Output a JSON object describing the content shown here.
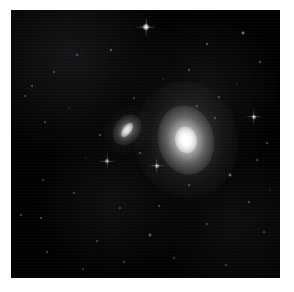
{
  "image": {
    "kind": "astronomical-photograph",
    "subject": "pair of galaxies in a sparse star field",
    "background_color": "#000000",
    "page_color": "#ffffff",
    "plate": {
      "left": 11,
      "top": 10,
      "width": 269,
      "height": 268
    },
    "caption": "",
    "title": ""
  },
  "galaxies": [
    {
      "name": "bright-elliptical-galaxy",
      "cx": 175,
      "cy": 130,
      "halo_w": 104,
      "halo_h": 118,
      "body_w": 56,
      "body_h": 70,
      "core_w": 22,
      "core_h": 27,
      "rotation": -12,
      "brightness": "bright"
    },
    {
      "name": "small-spiral-galaxy",
      "cx": 116,
      "cy": 120,
      "halo_w": 46,
      "halo_h": 52,
      "body_w": 26,
      "body_h": 34,
      "core_w": 9,
      "core_h": 17,
      "rotation": 38,
      "brightness": "faint"
    }
  ],
  "stars": [
    {
      "x": 135,
      "y": 17,
      "size": 7,
      "op": 0.95,
      "spike": 9
    },
    {
      "x": 232,
      "y": 23,
      "size": 4,
      "op": 0.55,
      "spike": 0
    },
    {
      "x": 196,
      "y": 34,
      "size": 3,
      "op": 0.4,
      "spike": 0
    },
    {
      "x": 100,
      "y": 40,
      "size": 3,
      "op": 0.38,
      "spike": 0
    },
    {
      "x": 66,
      "y": 45,
      "size": 3,
      "op": 0.34,
      "spike": 0
    },
    {
      "x": 249,
      "y": 52,
      "size": 3,
      "op": 0.38,
      "spike": 0
    },
    {
      "x": 43,
      "y": 62,
      "size": 3,
      "op": 0.3,
      "spike": 0
    },
    {
      "x": 178,
      "y": 60,
      "size": 3,
      "op": 0.32,
      "spike": 0
    },
    {
      "x": 21,
      "y": 76,
      "size": 3,
      "op": 0.34,
      "spike": 0
    },
    {
      "x": 14,
      "y": 86,
      "size": 3,
      "op": 0.3,
      "spike": 0
    },
    {
      "x": 208,
      "y": 87,
      "size": 3,
      "op": 0.32,
      "spike": 0
    },
    {
      "x": 123,
      "y": 88,
      "size": 3,
      "op": 0.3,
      "spike": 0
    },
    {
      "x": 243,
      "y": 107,
      "size": 5,
      "op": 0.72,
      "spike": 7
    },
    {
      "x": 204,
      "y": 108,
      "size": 3,
      "op": 0.3,
      "spike": 0
    },
    {
      "x": 34,
      "y": 112,
      "size": 3,
      "op": 0.3,
      "spike": 0
    },
    {
      "x": 89,
      "y": 125,
      "size": 3,
      "op": 0.32,
      "spike": 0
    },
    {
      "x": 96,
      "y": 151,
      "size": 5,
      "op": 0.62,
      "spike": 8
    },
    {
      "x": 146,
      "y": 156,
      "size": 5,
      "op": 0.7,
      "spike": 7
    },
    {
      "x": 129,
      "y": 143,
      "size": 3,
      "op": 0.34,
      "spike": 0
    },
    {
      "x": 256,
      "y": 133,
      "size": 3,
      "op": 0.36,
      "spike": 0
    },
    {
      "x": 246,
      "y": 150,
      "size": 3,
      "op": 0.32,
      "spike": 0
    },
    {
      "x": 219,
      "y": 165,
      "size": 4,
      "op": 0.48,
      "spike": 0
    },
    {
      "x": 178,
      "y": 175,
      "size": 3,
      "op": 0.3,
      "spike": 0
    },
    {
      "x": 32,
      "y": 170,
      "size": 3,
      "op": 0.28,
      "spike": 0
    },
    {
      "x": 63,
      "y": 183,
      "size": 3,
      "op": 0.3,
      "spike": 0
    },
    {
      "x": 148,
      "y": 196,
      "size": 3,
      "op": 0.3,
      "spike": 0
    },
    {
      "x": 109,
      "y": 198,
      "size": 3,
      "op": 0.28,
      "spike": 0
    },
    {
      "x": 238,
      "y": 192,
      "size": 3,
      "op": 0.3,
      "spike": 0
    },
    {
      "x": 10,
      "y": 205,
      "size": 3,
      "op": 0.34,
      "spike": 0
    },
    {
      "x": 30,
      "y": 208,
      "size": 3,
      "op": 0.34,
      "spike": 0
    },
    {
      "x": 196,
      "y": 214,
      "size": 3,
      "op": 0.28,
      "spike": 0
    },
    {
      "x": 139,
      "y": 225,
      "size": 4,
      "op": 0.4,
      "spike": 0
    },
    {
      "x": 86,
      "y": 231,
      "size": 3,
      "op": 0.3,
      "spike": 0
    },
    {
      "x": 253,
      "y": 222,
      "size": 3,
      "op": 0.28,
      "spike": 0
    },
    {
      "x": 36,
      "y": 242,
      "size": 3,
      "op": 0.3,
      "spike": 0
    },
    {
      "x": 163,
      "y": 248,
      "size": 3,
      "op": 0.28,
      "spike": 0
    },
    {
      "x": 113,
      "y": 252,
      "size": 3,
      "op": 0.26,
      "spike": 0
    },
    {
      "x": 215,
      "y": 255,
      "size": 3,
      "op": 0.26,
      "spike": 0
    },
    {
      "x": 72,
      "y": 259,
      "size": 3,
      "op": 0.26,
      "spike": 0
    },
    {
      "x": 186,
      "y": 96,
      "size": 3,
      "op": 0.28,
      "spike": 0
    },
    {
      "x": 58,
      "y": 98,
      "size": 2,
      "op": 0.24,
      "spike": 0
    },
    {
      "x": 152,
      "y": 69,
      "size": 2,
      "op": 0.24,
      "spike": 0
    },
    {
      "x": 226,
      "y": 74,
      "size": 2,
      "op": 0.22,
      "spike": 0
    },
    {
      "x": 75,
      "y": 148,
      "size": 2,
      "op": 0.22,
      "spike": 0
    },
    {
      "x": 259,
      "y": 180,
      "size": 2,
      "op": 0.24,
      "spike": 0
    }
  ]
}
